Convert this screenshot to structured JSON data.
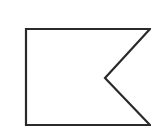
{
  "figure": {
    "shape": "swallowtail-flag",
    "stroke_color": "#2a2a2a",
    "fill_color": "#ffffff",
    "stroke_width": 2.2,
    "points": "26,29 150,29 105,78 150,125 26,125"
  }
}
